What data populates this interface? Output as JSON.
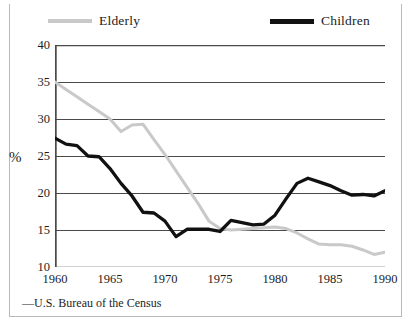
{
  "chart_data": {
    "type": "line",
    "title": "",
    "subtitle": "",
    "xlabel": "",
    "ylabel": "%",
    "xlim": [
      1960,
      1990
    ],
    "ylim": [
      10,
      40
    ],
    "yticks": [
      40,
      35,
      30,
      25,
      20,
      15,
      10
    ],
    "xticks": [
      1960,
      1965,
      1970,
      1975,
      1980,
      1985,
      1990
    ],
    "xtick_minor_step": 1,
    "grid": "horizontal",
    "legend_position": "top",
    "source": "—U.S. Bureau of the Census",
    "x": [
      1960,
      1961,
      1962,
      1963,
      1964,
      1965,
      1966,
      1967,
      1968,
      1969,
      1970,
      1971,
      1972,
      1973,
      1974,
      1975,
      1976,
      1977,
      1978,
      1979,
      1980,
      1981,
      1982,
      1983,
      1984,
      1985,
      1986,
      1987,
      1988,
      1989,
      1990
    ],
    "series": [
      {
        "name": "Elderly",
        "color": "#c9c9c9",
        "values": [
          35.0,
          34.0,
          33.0,
          32.0,
          31.0,
          30.0,
          28.3,
          29.2,
          29.3,
          27.2,
          25.2,
          23.0,
          20.8,
          18.6,
          16.2,
          15.2,
          15.0,
          15.1,
          15.2,
          15.3,
          15.4,
          15.2,
          14.6,
          13.8,
          13.1,
          13.0,
          13.0,
          12.8,
          12.3,
          11.7,
          12.0
        ]
      },
      {
        "name": "Children",
        "color": "#111111",
        "values": [
          27.4,
          26.6,
          26.4,
          25.0,
          24.9,
          23.3,
          21.3,
          19.6,
          17.4,
          17.3,
          16.2,
          14.1,
          15.1,
          15.1,
          15.1,
          14.8,
          16.3,
          16.0,
          15.7,
          15.8,
          17.0,
          19.2,
          21.3,
          22.0,
          21.5,
          21.0,
          20.3,
          19.7,
          19.8,
          19.6,
          20.3
        ]
      }
    ]
  },
  "legend": {
    "items": [
      {
        "label": "Elderly",
        "swatch": "line-swatch-gray"
      },
      {
        "label": "Children",
        "swatch": "line-swatch-black"
      }
    ]
  },
  "axes": {
    "y_label": "%",
    "y_ticks": [
      "40",
      "35",
      "30",
      "25",
      "20",
      "15",
      "10"
    ],
    "x_ticks": [
      "1960",
      "1965",
      "1970",
      "1975",
      "1980",
      "1985",
      "1990"
    ]
  },
  "footer": {
    "source": "—U.S. Bureau of the Census"
  }
}
